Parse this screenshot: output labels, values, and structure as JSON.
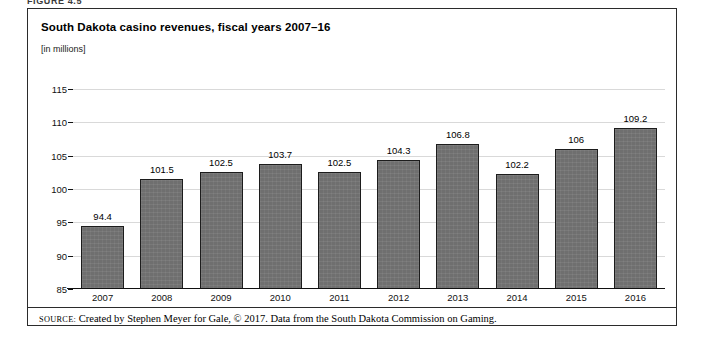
{
  "figure": {
    "label": "FIGURE 4.5",
    "title": "South Dakota casino revenues, fiscal years 2007–16",
    "subtitle": "[in millions]",
    "source_prefix": "SOURCE:",
    "source_text": "Created by Stephen Meyer for Gale, © 2017. Data from the South Dakota Commission on Gaming."
  },
  "style": {
    "bar_fill": "#6f6f6f",
    "bar_border": "#1c1c1c",
    "frame": "#2b2b2b",
    "grid": "#b9b9b9"
  },
  "chart_data": {
    "type": "bar",
    "title": "South Dakota casino revenues, fiscal years 2007–16",
    "subtitle": "[in millions]",
    "xlabel": "",
    "ylabel": "[in millions]",
    "ylim": [
      85,
      115
    ],
    "ytick_step": 5,
    "yticks": [
      85,
      90,
      95,
      100,
      105,
      110,
      115
    ],
    "ytick_labels": [
      "85",
      "90",
      "95",
      "100",
      "105",
      "110",
      "115"
    ],
    "grid": true,
    "legend": null,
    "categories": [
      "2007",
      "2008",
      "2009",
      "2010",
      "2011",
      "2012",
      "2013",
      "2014",
      "2015",
      "2016"
    ],
    "values": [
      94.4,
      101.5,
      102.5,
      103.7,
      102.5,
      104.3,
      106.8,
      102.2,
      106,
      109.2
    ],
    "value_labels": [
      "94.4",
      "101.5",
      "102.5",
      "103.7",
      "102.5",
      "104.3",
      "106.8",
      "102.2",
      "106",
      "109.2"
    ]
  }
}
